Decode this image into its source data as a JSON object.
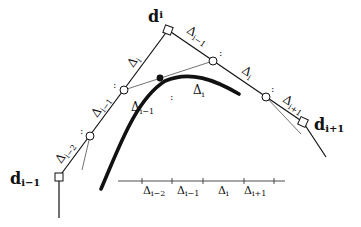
{
  "diagram": {
    "control_points": {
      "d_i": {
        "label": "d",
        "sub": "i"
      },
      "d_im1": {
        "label": "d",
        "sub": "i−1"
      },
      "d_ip1": {
        "label": "d",
        "sub": "i+1"
      }
    },
    "polygon_labels": {
      "left_upper": {
        "label": "Δ",
        "sub": "i"
      },
      "left_mid": {
        "label": "Δ",
        "sub": "i−1"
      },
      "left_lower": {
        "label": "Δ",
        "sub": "i−2"
      },
      "right_upper": {
        "label": "Δ",
        "sub": "i−1"
      },
      "right_mid": {
        "label": "Δ",
        "sub": "i"
      },
      "right_lower": {
        "label": "Δ",
        "sub": "i+1"
      }
    },
    "curve_labels": {
      "inner_left": {
        "label": "Δ",
        "sub": "i−1"
      },
      "inner_right": {
        "label": "Δ",
        "sub": "i"
      }
    },
    "separator": ":",
    "knot_axis": {
      "labels": [
        {
          "label": "Δ",
          "sub": "i−2"
        },
        {
          "label": "Δ",
          "sub": "i−1"
        },
        {
          "label": "Δ",
          "sub": "i"
        },
        {
          "label": "Δ",
          "sub": "i+1"
        }
      ]
    },
    "colors": {
      "ink": "#111111",
      "background": "#ffffff"
    }
  }
}
